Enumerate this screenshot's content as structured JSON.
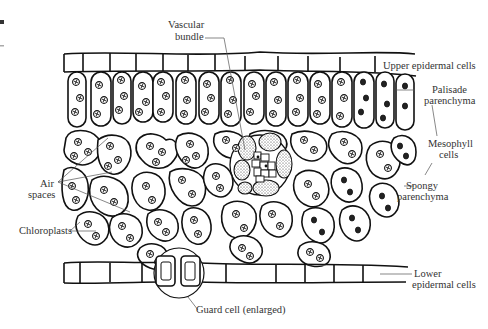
{
  "diagram": {
    "type": "leaf cross-section (biological illustration)",
    "labels": {
      "vascular_bundle_line1": "Vascular",
      "vascular_bundle_line2": "bundle",
      "upper_epidermal": "Upper epidermal cells",
      "palisade_line1": "Palisade",
      "palisade_line2": "parenchyma",
      "mesophyll_line1": "Mesophyll",
      "mesophyll_line2": "cells",
      "spongy_line1": "Spongy",
      "spongy_line2": "parenchyma",
      "air_spaces_line1": "Air",
      "air_spaces_line2": "spaces",
      "chloroplasts": "Chloroplasts",
      "lower_epidermal_line1": "Lower",
      "lower_epidermal_line2": "epidermal cells",
      "guard_cell": "Guard cell (enlarged)"
    },
    "colors": {
      "line": "#111111",
      "label_text": "#333333",
      "leader": "#555555",
      "background": "#ffffff"
    }
  }
}
